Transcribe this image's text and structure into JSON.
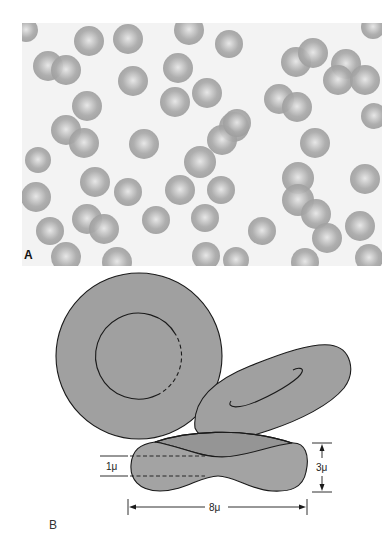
{
  "figure": {
    "panel_a": {
      "label": "A",
      "kind": "micrograph",
      "background_color": "#f3f3f3",
      "cell_color": "#a8a8a8",
      "cell_center_color": "#e4e4e4",
      "cells": [
        {
          "x": 89,
          "y": 41,
          "r": 15
        },
        {
          "x": 128,
          "y": 39,
          "r": 15
        },
        {
          "x": 189,
          "y": 30,
          "r": 15
        },
        {
          "x": 229,
          "y": 44,
          "r": 14
        },
        {
          "x": 26,
          "y": 30,
          "r": 12
        },
        {
          "x": 373,
          "y": 27,
          "r": 12
        },
        {
          "x": 48,
          "y": 66,
          "r": 15
        },
        {
          "x": 66,
          "y": 70,
          "r": 15
        },
        {
          "x": 133,
          "y": 81,
          "r": 15
        },
        {
          "x": 178,
          "y": 68,
          "r": 15
        },
        {
          "x": 296,
          "y": 62,
          "r": 15
        },
        {
          "x": 313,
          "y": 53,
          "r": 15
        },
        {
          "x": 346,
          "y": 64,
          "r": 15
        },
        {
          "x": 338,
          "y": 80,
          "r": 15
        },
        {
          "x": 365,
          "y": 80,
          "r": 15
        },
        {
          "x": 175,
          "y": 102,
          "r": 15
        },
        {
          "x": 87,
          "y": 106,
          "r": 15
        },
        {
          "x": 207,
          "y": 93,
          "r": 15
        },
        {
          "x": 279,
          "y": 99,
          "r": 15
        },
        {
          "x": 297,
          "y": 107,
          "r": 15
        },
        {
          "x": 374,
          "y": 116,
          "r": 13
        },
        {
          "x": 66,
          "y": 130,
          "r": 15
        },
        {
          "x": 84,
          "y": 143,
          "r": 15
        },
        {
          "x": 144,
          "y": 144,
          "r": 15
        },
        {
          "x": 234,
          "y": 127,
          "r": 15
        },
        {
          "x": 222,
          "y": 140,
          "r": 15
        },
        {
          "x": 200,
          "y": 162,
          "r": 16
        },
        {
          "x": 237,
          "y": 123,
          "r": 14
        },
        {
          "x": 315,
          "y": 143,
          "r": 15
        },
        {
          "x": 38,
          "y": 160,
          "r": 13
        },
        {
          "x": 95,
          "y": 182,
          "r": 15
        },
        {
          "x": 128,
          "y": 192,
          "r": 14
        },
        {
          "x": 180,
          "y": 190,
          "r": 15
        },
        {
          "x": 221,
          "y": 190,
          "r": 14
        },
        {
          "x": 36,
          "y": 197,
          "r": 15
        },
        {
          "x": 298,
          "y": 178,
          "r": 16
        },
        {
          "x": 298,
          "y": 200,
          "r": 16
        },
        {
          "x": 365,
          "y": 179,
          "r": 15
        },
        {
          "x": 205,
          "y": 218,
          "r": 14
        },
        {
          "x": 87,
          "y": 219,
          "r": 15
        },
        {
          "x": 104,
          "y": 229,
          "r": 15
        },
        {
          "x": 156,
          "y": 220,
          "r": 14
        },
        {
          "x": 50,
          "y": 231,
          "r": 14
        },
        {
          "x": 262,
          "y": 231,
          "r": 14
        },
        {
          "x": 316,
          "y": 214,
          "r": 15
        },
        {
          "x": 327,
          "y": 238,
          "r": 15
        },
        {
          "x": 360,
          "y": 226,
          "r": 15
        },
        {
          "x": 66,
          "y": 257,
          "r": 15
        },
        {
          "x": 117,
          "y": 262,
          "r": 15
        },
        {
          "x": 206,
          "y": 256,
          "r": 14
        },
        {
          "x": 236,
          "y": 260,
          "r": 13
        },
        {
          "x": 305,
          "y": 262,
          "r": 14
        },
        {
          "x": 369,
          "y": 258,
          "r": 14
        }
      ]
    },
    "panel_b": {
      "label": "B",
      "kind": "schematic",
      "fill_color": "#a0a0a0",
      "fill_dark_color": "#959595",
      "stroke_color": "#1a1a1a",
      "face_view": {
        "cx": 139,
        "cy": 356,
        "r": 83,
        "inner_r": 43
      },
      "tilted_view": {
        "highlight_curve": "spiral"
      },
      "cross_section": {
        "thickness_label": "3μ",
        "center_thickness_label": "1μ",
        "diameter_label": "8μ"
      }
    }
  }
}
